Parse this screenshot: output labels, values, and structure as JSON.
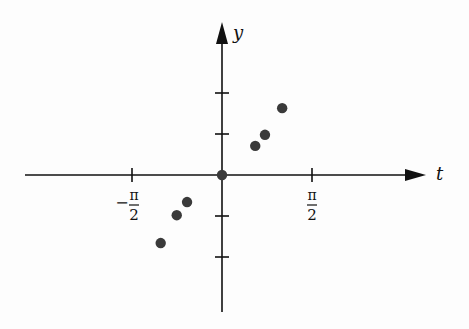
{
  "chart_data": {
    "type": "scatter",
    "title": "",
    "xlabel": "t",
    "ylabel": "y",
    "x_ticks": [
      {
        "value": -1.5708,
        "label_sign": "−",
        "label_num": "π",
        "label_den": "2"
      },
      {
        "value": 1.5708,
        "label_sign": "",
        "label_num": "π",
        "label_den": "2"
      }
    ],
    "y_ticks": [
      -2,
      -1,
      1,
      2
    ],
    "y_tick_labels_shown": false,
    "points": [
      {
        "t": -1.07,
        "y": -1.66
      },
      {
        "t": -0.79,
        "y": -0.98
      },
      {
        "t": -0.61,
        "y": -0.66
      },
      {
        "t": 0.0,
        "y": 0.0
      },
      {
        "t": 0.58,
        "y": 0.71
      },
      {
        "t": 0.75,
        "y": 0.98
      },
      {
        "t": 1.05,
        "y": 1.63
      }
    ],
    "xlim": [
      -3.46,
      3.56
    ],
    "ylim": [
      -3.34,
      3.76
    ],
    "grid": false,
    "legend": null,
    "colors": {
      "axis": "#111111",
      "points": "#3a3a3a",
      "background": "#fdfdfd"
    }
  }
}
